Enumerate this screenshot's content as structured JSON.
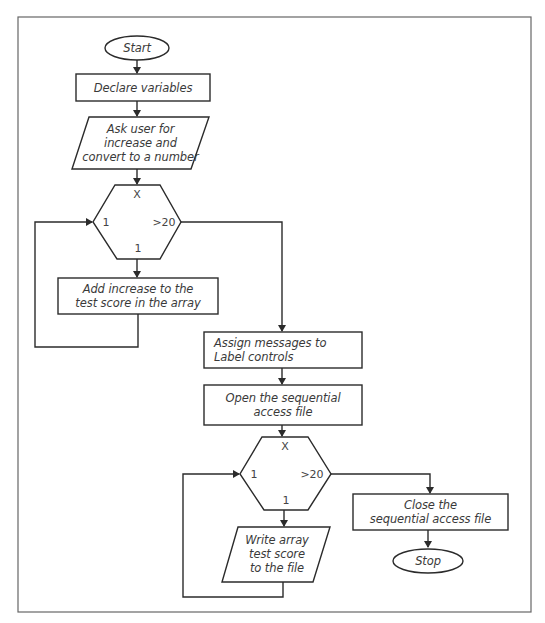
{
  "diagram": {
    "type": "flowchart",
    "colors": {
      "stroke": "#2b2b2b",
      "frame": "#555555",
      "text": "#3a3a3a",
      "background": "#ffffff"
    },
    "nodes": {
      "start": {
        "shape": "terminator",
        "label": "Start"
      },
      "declare": {
        "shape": "process",
        "label": "Declare variables"
      },
      "ask_user": {
        "shape": "input-output",
        "label": "Ask user for\nincrease and\nconvert to a number"
      },
      "loop1": {
        "shape": "loop-hexagon",
        "top": "X",
        "left": "1",
        "right": ">20",
        "bottom": "1"
      },
      "add_increase": {
        "shape": "process",
        "label": "Add increase to the\ntest score in the array"
      },
      "assign_messages": {
        "shape": "process",
        "label": "Assign messages to\nLabel controls"
      },
      "open_file": {
        "shape": "process",
        "label": "Open the sequential\naccess file"
      },
      "loop2": {
        "shape": "loop-hexagon",
        "top": "X",
        "left": "1",
        "right": ">20",
        "bottom": "1"
      },
      "write_array": {
        "shape": "input-output",
        "label": "Write array\ntest score\nto the file"
      },
      "close_file": {
        "shape": "process",
        "label": "Close the\nsequential access file"
      },
      "stop": {
        "shape": "terminator",
        "label": "Stop"
      }
    },
    "edges": [
      [
        "start",
        "declare"
      ],
      [
        "declare",
        "ask_user"
      ],
      [
        "ask_user",
        "loop1"
      ],
      [
        "loop1",
        "add_increase"
      ],
      [
        "add_increase",
        "loop1"
      ],
      [
        "loop1",
        "assign_messages"
      ],
      [
        "assign_messages",
        "open_file"
      ],
      [
        "open_file",
        "loop2"
      ],
      [
        "loop2",
        "write_array"
      ],
      [
        "write_array",
        "loop2"
      ],
      [
        "loop2",
        "close_file"
      ],
      [
        "close_file",
        "stop"
      ]
    ]
  }
}
